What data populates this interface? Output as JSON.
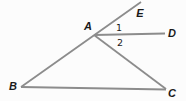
{
  "figure": {
    "type": "geometry-diagram",
    "points": {
      "A": {
        "label": "A",
        "x": 94,
        "y": 35
      },
      "B": {
        "label": "B",
        "x": 21,
        "y": 87
      },
      "C": {
        "label": "C",
        "x": 166,
        "y": 89
      },
      "D": {
        "label": "D",
        "x": 165,
        "y": 33
      },
      "E": {
        "label": "E",
        "x": 141,
        "y": 2
      }
    },
    "segments": [
      {
        "name": "line-B-A-E",
        "from": "B",
        "to": "E"
      },
      {
        "name": "ray-A-D",
        "from": "A",
        "to": "D"
      },
      {
        "name": "segment-A-C",
        "from": "A",
        "to": "C"
      },
      {
        "name": "segment-B-C",
        "from": "B",
        "to": "C"
      }
    ],
    "angles": {
      "angle1": {
        "label": "1",
        "x": 119,
        "y": 27
      },
      "angle2": {
        "label": "2",
        "x": 120,
        "y": 42
      }
    }
  },
  "colors": {
    "line": "#8c8c8c",
    "text": "#1a1a1a",
    "background": "#fcfcfc"
  }
}
